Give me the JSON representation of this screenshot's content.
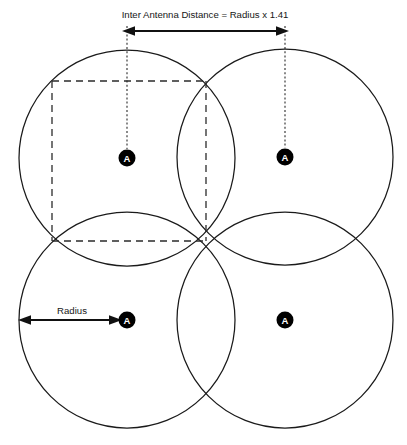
{
  "diagram": {
    "type": "antenna-coverage-geometry",
    "title": "Inter Antenna Distance = Radius x 1.41",
    "radius_label": "Radius",
    "antenna_letter": "A",
    "colors": {
      "circle_stroke": "#1a1a1a",
      "dashed_stroke": "#2b2b2b",
      "dim_line": "#111111",
      "antenna_fill": "#000000",
      "antenna_text": "#ffffff",
      "background": "#ffffff"
    },
    "geometry": {
      "radius": 108,
      "antennas": [
        {
          "name": "antenna-top-left",
          "cx": 127,
          "cy": 158
        },
        {
          "name": "antenna-top-right",
          "cx": 285,
          "cy": 157
        },
        {
          "name": "antenna-bottom-left",
          "cx": 127,
          "cy": 320
        },
        {
          "name": "antenna-bottom-right",
          "cx": 285,
          "cy": 320
        }
      ],
      "antenna_marker_radius": 8.5,
      "square": {
        "left": 52,
        "top": 81,
        "right": 206,
        "bottom": 241
      },
      "inter_antenna_dimension": {
        "y": 31,
        "x_start": 126,
        "x_end": 285,
        "leader_top": 36,
        "leader_bottom_left": 149,
        "leader_bottom_right": 148
      },
      "radius_dimension": {
        "y": 320,
        "x_start": 21,
        "x_end": 119,
        "label_x": 72,
        "label_y": 314
      },
      "title_position": {
        "x": 205,
        "y": 18
      }
    }
  }
}
